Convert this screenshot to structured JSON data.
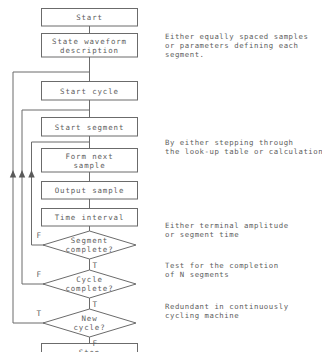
{
  "diagram": {
    "stroke_color": "#6b6b6b",
    "text_color": "#5d5d5d",
    "background_color": "#ffffff",
    "nodes": [
      {
        "id": "start",
        "type": "process",
        "lines": [
          "Start"
        ]
      },
      {
        "id": "state",
        "type": "process",
        "lines": [
          "State waveform",
          "description"
        ]
      },
      {
        "id": "start_cycle",
        "type": "process",
        "lines": [
          "Start cycle"
        ]
      },
      {
        "id": "start_seg",
        "type": "process",
        "lines": [
          "Start segment"
        ]
      },
      {
        "id": "form_next",
        "type": "process",
        "lines": [
          "Form next",
          "sample"
        ]
      },
      {
        "id": "output",
        "type": "process",
        "lines": [
          "Output sample"
        ]
      },
      {
        "id": "time_int",
        "type": "process",
        "lines": [
          "Time interval"
        ]
      },
      {
        "id": "seg_done",
        "type": "decision",
        "lines": [
          "Segment",
          "complete?"
        ]
      },
      {
        "id": "cycle_done",
        "type": "decision",
        "lines": [
          "Cycle",
          "complete?"
        ]
      },
      {
        "id": "new_cycle",
        "type": "decision",
        "lines": [
          "New",
          "cycle?"
        ]
      },
      {
        "id": "stop",
        "type": "process",
        "lines": [
          "Stop"
        ]
      }
    ],
    "branch_labels": [
      {
        "id": "seg_false",
        "text": "F"
      },
      {
        "id": "seg_true",
        "text": "T"
      },
      {
        "id": "cycle_false",
        "text": "F"
      },
      {
        "id": "cycle_true",
        "text": "T"
      },
      {
        "id": "new_true",
        "text": "T"
      },
      {
        "id": "new_false",
        "text": "F"
      }
    ],
    "annotations": [
      {
        "id": "annot_state",
        "lines": [
          "Either equally spaced samples",
          "or parameters defining each",
          "segment."
        ]
      },
      {
        "id": "annot_form",
        "lines": [
          "By either stepping through",
          "the look-up table or calculation"
        ]
      },
      {
        "id": "annot_seg",
        "lines": [
          "Either terminal amplitude",
          "or segment time"
        ]
      },
      {
        "id": "annot_cycle",
        "lines": [
          "Test for the completion",
          "of N segments"
        ]
      },
      {
        "id": "annot_new",
        "lines": [
          "Redundant in continuously",
          "cycling machine"
        ]
      }
    ]
  }
}
